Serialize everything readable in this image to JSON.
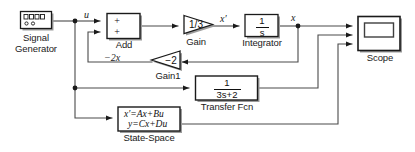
{
  "diagram": {
    "type": "control-system-block-diagram",
    "colors": {
      "background": "#ffffff",
      "line": "#3f3f3f",
      "block_border": "#1a1a1a",
      "block_fill": "#ffffff",
      "shadow": "#9a9a9a",
      "text": "#1a1a1a"
    }
  },
  "blocks": {
    "signal_generator": {
      "name": "Signal Generator",
      "label_line1": "Signal",
      "label_line2": "Generator",
      "icon": "signal-generator-icon"
    },
    "add": {
      "name": "Add",
      "label": "Add",
      "port1_sign": "+",
      "port2_sign": "+"
    },
    "gain": {
      "name": "Gain",
      "label": "Gain",
      "value": "1/3"
    },
    "integrator": {
      "name": "Integrator",
      "label": "Integrator",
      "numerator": "1",
      "denominator": "s"
    },
    "scope": {
      "name": "Scope",
      "label": "Scope",
      "input_count": 3
    },
    "gain1": {
      "name": "Gain1",
      "label": "Gain1",
      "value": "−2"
    },
    "transfer_fcn": {
      "name": "Transfer Fcn",
      "label": "Transfer Fcn",
      "numerator": "1",
      "denominator": "3s+2"
    },
    "state_space": {
      "name": "State-Space",
      "label": "State-Space",
      "equation_line1": "x′=Ax+Bu",
      "equation_line2": "y=Cx+Du"
    }
  },
  "signal_labels": {
    "u": "u",
    "minus_two_x": "−2x",
    "x_prime": "x′",
    "x": "x"
  }
}
